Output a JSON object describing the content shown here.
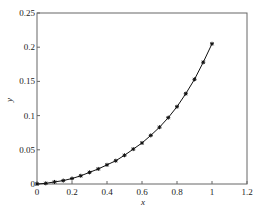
{
  "chart_data": {
    "type": "line",
    "title": "",
    "xlabel": "x",
    "ylabel": "y",
    "xlim": [
      0,
      1.2
    ],
    "ylim": [
      0,
      0.25
    ],
    "xticks": [
      "0",
      "0.2",
      "0.4",
      "0.6",
      "0.8",
      "1",
      "1.2"
    ],
    "yticks": [
      "0",
      "0.05",
      "0.1",
      "0.15",
      "0.2",
      "0.25"
    ],
    "grid": false,
    "legend": null,
    "series": [
      {
        "name": "y(x)",
        "marker": "asterisk",
        "color": "#111111",
        "x": [
          0,
          0.05,
          0.1,
          0.15,
          0.2,
          0.25,
          0.3,
          0.35,
          0.4,
          0.45,
          0.5,
          0.55,
          0.6,
          0.65,
          0.7,
          0.75,
          0.8,
          0.85,
          0.9,
          0.95,
          1.0
        ],
        "y": [
          0,
          0.001,
          0.003,
          0.005,
          0.008,
          0.012,
          0.017,
          0.022,
          0.028,
          0.034,
          0.042,
          0.051,
          0.06,
          0.071,
          0.083,
          0.097,
          0.113,
          0.132,
          0.153,
          0.178,
          0.205
        ]
      }
    ]
  }
}
